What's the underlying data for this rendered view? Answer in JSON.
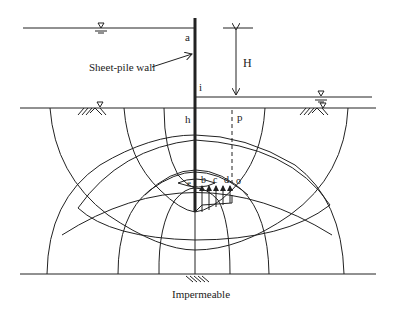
{
  "diagram": {
    "labels": {
      "a": "a",
      "i": "i",
      "h": "h",
      "p": "p",
      "b": "b",
      "c": "c",
      "d": "d",
      "e": "e",
      "o": "o",
      "H": "H",
      "wall": "Sheet-pile wall",
      "bottom": "Impermeable"
    },
    "colors": {
      "line": "#222222",
      "background": "#ffffff"
    }
  }
}
